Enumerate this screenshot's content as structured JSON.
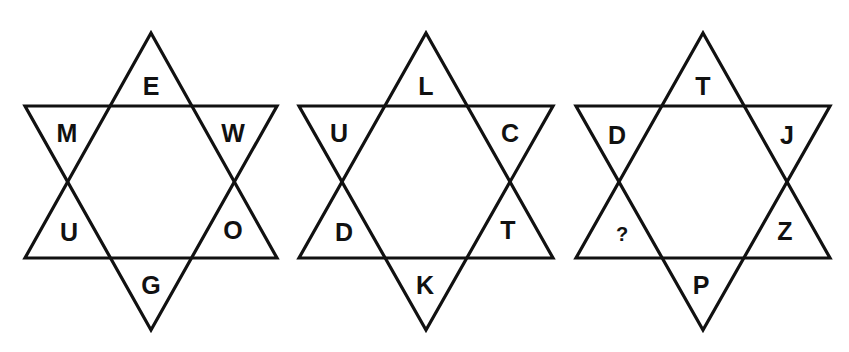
{
  "puzzle": {
    "stars": [
      {
        "id": "star-1",
        "letters": {
          "top": "E",
          "upper_left": "M",
          "upper_right": "W",
          "lower_left": "U",
          "lower_right": "O",
          "bottom": "G"
        }
      },
      {
        "id": "star-2",
        "letters": {
          "top": "L",
          "upper_left": "U",
          "upper_right": "C",
          "lower_left": "D",
          "lower_right": "T",
          "bottom": "K"
        }
      },
      {
        "id": "star-3",
        "letters": {
          "top": "T",
          "upper_left": "D",
          "upper_right": "J",
          "lower_left": "?",
          "lower_right": "Z",
          "bottom": "P"
        }
      }
    ],
    "colors": {
      "line": "#111111",
      "background": "#ffffff"
    }
  }
}
